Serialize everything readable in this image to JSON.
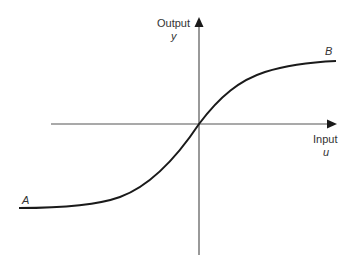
{
  "diagram": {
    "type": "sigmoid input-output characteristic",
    "y_axis": {
      "label": "Output",
      "symbol": "y"
    },
    "x_axis": {
      "label": "Input",
      "symbol": "u"
    },
    "curve": {
      "start_point_label": "A",
      "end_point_label": "B",
      "shape": "S-shaped curve passing through origin, saturating at both ends"
    },
    "colors": {
      "axis": "#444444",
      "curve": "#1a1a1a",
      "text": "#333333"
    }
  }
}
